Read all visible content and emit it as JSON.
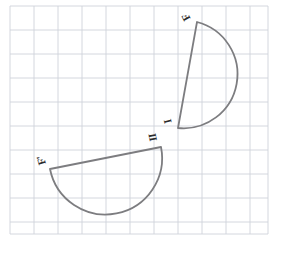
{
  "canvas": {
    "width": 284,
    "height": 253,
    "background_color": "#ffffff"
  },
  "grid": {
    "name": "graph-paper-grid",
    "line_color": "#cfd3da",
    "border_color": "#c9ced6",
    "cell_size": 24,
    "origin_x": 10,
    "origin_y": 6,
    "columns": 11,
    "rows": 10,
    "right_edge": 268,
    "bottom_edge": 234,
    "visible": true
  },
  "figure": {
    "title": "",
    "stroke_color": "#7d7d80",
    "stroke_width": 1.8,
    "fill": "none",
    "shapes": [
      {
        "name": "upper-half-disk",
        "kind": "half-disk",
        "chord_start": {
          "x": 197,
          "y": 22
        },
        "chord_end": {
          "x": 178,
          "y": 128
        },
        "arc_sweep": "right",
        "radius": 54,
        "labels": [
          "F",
          "I"
        ]
      },
      {
        "name": "lower-half-disk",
        "kind": "half-disk",
        "chord_start": {
          "x": 50,
          "y": 169
        },
        "chord_end": {
          "x": 161,
          "y": 147
        },
        "arc_sweep": "below",
        "radius": 56,
        "labels": [
          "F'",
          "II"
        ]
      }
    ]
  },
  "labels": {
    "upper_top": "F",
    "upper_bottom": "I",
    "lower_right": "II",
    "lower_left": "F'"
  }
}
